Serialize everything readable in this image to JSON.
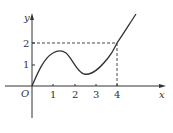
{
  "figure": {
    "type": "function-graph",
    "axes": {
      "x_label": "x",
      "y_label": "y",
      "origin_label": "O",
      "x_ticks": [
        "1",
        "2",
        "3",
        "4"
      ],
      "y_ticks": [
        "1",
        "2"
      ]
    },
    "curve": {
      "description": "smooth curve through origin, local max near (1.4, 1.6), local min near (2.5, 0.55), passes through (4, 2), increasing afterward",
      "points": [
        [
          0,
          0
        ],
        [
          0.5,
          0.95
        ],
        [
          1,
          1.5
        ],
        [
          1.36,
          1.63
        ],
        [
          1.8,
          1.35
        ],
        [
          2.2,
          0.8
        ],
        [
          2.5,
          0.55
        ],
        [
          3,
          0.75
        ],
        [
          3.5,
          1.3
        ],
        [
          4,
          2
        ],
        [
          4.5,
          2.8
        ],
        [
          4.9,
          3.4
        ]
      ]
    },
    "guides": {
      "point": [
        4,
        2
      ],
      "style": "dashed"
    },
    "colors": {
      "line": "#333333",
      "background": "#ffffff"
    }
  }
}
